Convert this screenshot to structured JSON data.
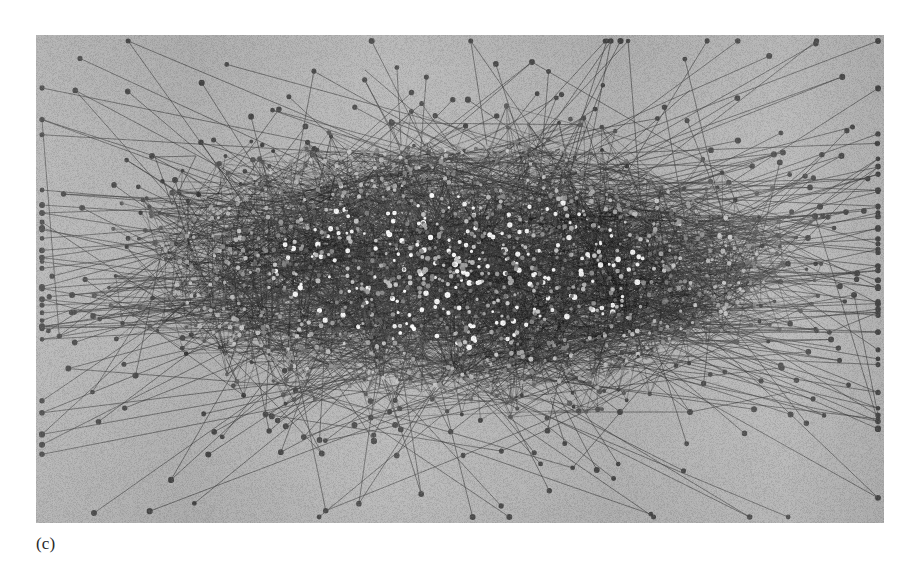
{
  "figure": {
    "caption": "(c)",
    "caption_x": 36,
    "caption_y": 535,
    "canvas_width": 910,
    "canvas_height": 569,
    "page_background": "#ffffff"
  },
  "plate": {
    "x": 36,
    "y": 35,
    "width": 848,
    "height": 488,
    "background_color": "#b6b6b6",
    "grain": "scanned-paper-noise"
  },
  "chart_data": {
    "type": "scatter",
    "title": "",
    "subtitle": "",
    "xlabel": "",
    "ylabel": "",
    "grid": false,
    "legend": null,
    "annotations": [
      "(c)"
    ],
    "graph": {
      "layout": "force-directed",
      "node_count": 1600,
      "core_node_count": 1360,
      "periphery_node_count": 240,
      "edge_count": 4200,
      "directed": false,
      "center_x": 460,
      "center_y": 268,
      "core_radius_x": 300,
      "core_radius_y": 128,
      "halo_radius_x": 352,
      "halo_radius_y": 158,
      "periphery_radius_x": 400,
      "periphery_radius_y": 196,
      "node_color_core_bright": "#f2f2f2",
      "node_color_core_mid": "#9a9a9a",
      "node_color_periphery": "#4a4a4a",
      "edge_color_core": "#1b1b1b",
      "edge_color_periphery": "#3d3d3d",
      "node_radius_core_min": 1.4,
      "node_radius_core_max": 2.9,
      "node_radius_periphery": 2.3,
      "edge_width_core": 0.55,
      "edge_width_periphery": 0.7,
      "random_seed": 20240517
    },
    "landmarks": [
      {
        "name": "left-triangle-motif",
        "x": 175,
        "y": 180
      },
      {
        "name": "far-right-isolated-node",
        "x": 808,
        "y": 238
      },
      {
        "name": "long-bottom-horizontal-edge",
        "x": 620,
        "y": 412
      },
      {
        "name": "bottom-right-corner-node",
        "x": 690,
        "y": 412
      },
      {
        "name": "top-outlier-node",
        "x": 532,
        "y": 62
      },
      {
        "name": "left-outlier-node",
        "x": 152,
        "y": 156
      }
    ]
  }
}
